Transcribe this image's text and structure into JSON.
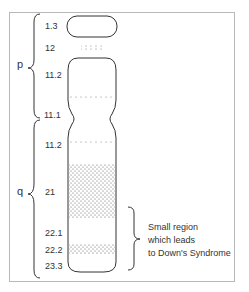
{
  "diagram": {
    "arms": {
      "p": "p",
      "q": "q"
    },
    "bands": [
      {
        "label": "1.3"
      },
      {
        "label": "12"
      },
      {
        "label": "11.2"
      },
      {
        "label": "11.1"
      },
      {
        "label": "11.2"
      },
      {
        "label": "21"
      },
      {
        "label": "22.1"
      },
      {
        "label": "22.2"
      },
      {
        "label": "23.3"
      }
    ],
    "annotation": {
      "lines": [
        "Small region",
        "which leads",
        "to Down's Syndrome"
      ]
    },
    "colors": {
      "outline": "#333333",
      "stipple": "#555555",
      "frame": "#b8b8b8"
    }
  }
}
